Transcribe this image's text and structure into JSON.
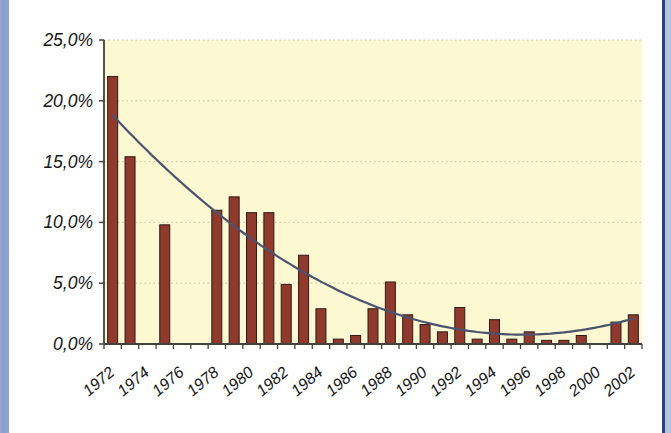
{
  "page": {
    "background": "#ffffff",
    "left_border_color": "#8da0cd",
    "right_border_line_color": "#24427e",
    "right_border_strip_color": "#b6c2e2"
  },
  "chart_data": {
    "type": "bar",
    "title": "",
    "xlabel": "",
    "ylabel": "",
    "categories": [
      "1972",
      "1973",
      "1974",
      "1975",
      "1976",
      "1977",
      "1978",
      "1979",
      "1980",
      "1981",
      "1982",
      "1983",
      "1984",
      "1985",
      "1986",
      "1987",
      "1988",
      "1989",
      "1990",
      "1991",
      "1992",
      "1993",
      "1994",
      "1995",
      "1996",
      "1997",
      "1998",
      "1999",
      "2000",
      "2001",
      "2002"
    ],
    "values": [
      22.0,
      15.4,
      0,
      9.8,
      0,
      0,
      11.0,
      12.1,
      10.8,
      10.8,
      4.9,
      7.3,
      2.9,
      0.4,
      0.7,
      2.9,
      5.1,
      2.4,
      1.6,
      1.0,
      3.0,
      0.4,
      2.0,
      0.4,
      1.0,
      0.3,
      0.3,
      0.7,
      0,
      1.8,
      2.4
    ],
    "x_tick_labels": [
      "1972",
      "1974",
      "1976",
      "1978",
      "1980",
      "1982",
      "1984",
      "1986",
      "1988",
      "1990",
      "1992",
      "1994",
      "1996",
      "1998",
      "2000",
      "2002"
    ],
    "x_label_every": 2,
    "y_tick_labels": [
      "0,0%",
      "5,0%",
      "10,0%",
      "15,0%",
      "20,0%",
      "25,0%"
    ],
    "y_tick_values": [
      0,
      5,
      10,
      15,
      20,
      25
    ],
    "ylim": [
      0,
      25
    ],
    "grid": "horizontal dotted lines at 5% steps",
    "legend": "none",
    "trendline": {
      "type": "polynomial",
      "a": 0.0324,
      "vertex_index": 23.6,
      "min_value": 0.77,
      "start_value": 18.8,
      "end_value": 2.1,
      "color": "#4c536f"
    },
    "colors": {
      "plot_background": "#fbf8d2",
      "bar_fill": "#8f3a2c",
      "bar_border": "#301a16",
      "gridline": "#c2bda0",
      "axis": "#44423c",
      "label": "#161616"
    }
  }
}
